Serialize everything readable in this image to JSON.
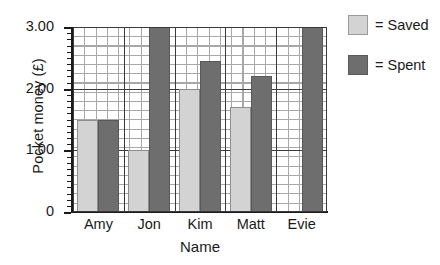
{
  "chart_data": {
    "type": "bar",
    "title": "",
    "xlabel": "Name",
    "ylabel": "Pocket money (£)",
    "categories": [
      "Amy",
      "Jon",
      "Kim",
      "Matt",
      "Evie"
    ],
    "series": [
      {
        "name": "Saved",
        "color": "#d3d3d3",
        "values": [
          1.5,
          1.0,
          2.0,
          1.7,
          null
        ]
      },
      {
        "name": "Spent",
        "color": "#6e6e6e",
        "values": [
          1.5,
          3.0,
          2.45,
          2.2,
          3.0
        ]
      }
    ],
    "ylim": [
      0,
      3.0
    ],
    "yticks": [
      0,
      1.0,
      2.0,
      3.0
    ],
    "ytick_labels": [
      "0",
      "1.00",
      "2.00",
      "3.00"
    ],
    "minor_tick_step": 0.1,
    "grid": true,
    "legend_position": "right"
  },
  "legend": {
    "items": [
      {
        "label": "= Saved",
        "swatch": "saved"
      },
      {
        "label": "= Spent",
        "swatch": "spent"
      }
    ]
  }
}
